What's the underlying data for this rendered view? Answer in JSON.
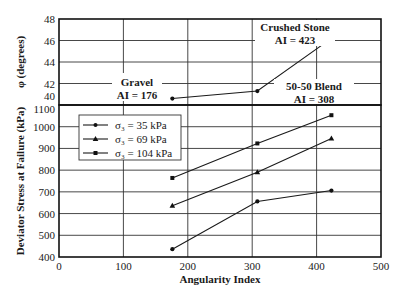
{
  "chart_data": [
    {
      "type": "line",
      "panel": "top",
      "title": "",
      "xlabel": "",
      "ylabel": "φ (degrees)",
      "ylim": [
        40,
        48
      ],
      "yticks": [
        40,
        42,
        44,
        46,
        48
      ],
      "xlim": [
        0,
        500
      ],
      "grid": true,
      "series": [
        {
          "name": "Friction angle",
          "x": [
            176,
            308,
            423
          ],
          "values": [
            40.6,
            41.3,
            46.2
          ],
          "marker": "circle"
        }
      ],
      "annotations": [
        {
          "lines": [
            "Gravel",
            "AI = 176"
          ],
          "x": 176,
          "y": 40.6
        },
        {
          "lines": [
            "50-50 Blend",
            "AI = 308"
          ],
          "x": 308,
          "y": 41.3
        },
        {
          "lines": [
            "Crushed Stone",
            "AI = 423"
          ],
          "x": 423,
          "y": 46.2
        }
      ]
    },
    {
      "type": "line",
      "panel": "bottom",
      "title": "",
      "xlabel": "Angularity Index",
      "ylabel": "Deviator Stress at Failure (kPa)",
      "xlim": [
        0,
        500
      ],
      "xticks": [
        0,
        100,
        200,
        300,
        400,
        500
      ],
      "ylim": [
        400,
        1100
      ],
      "yticks": [
        400,
        500,
        600,
        700,
        800,
        900,
        1000,
        1100
      ],
      "grid": true,
      "legend_position": "upper left",
      "categories": [
        176,
        308,
        423
      ],
      "series": [
        {
          "name": "σ₃ = 35 kPa",
          "values": [
            436,
            656,
            706
          ],
          "marker": "circle"
        },
        {
          "name": "σ₃ = 69 kPa",
          "values": [
            636,
            790,
            946
          ],
          "marker": "triangle"
        },
        {
          "name": "σ₃ = 104 kPa",
          "values": [
            764,
            923,
            1053
          ],
          "marker": "square"
        }
      ]
    }
  ],
  "labels": {
    "top_ylabel": "φ (degrees)",
    "bottom_ylabel": "Deviator Stress at Failure (kPa)",
    "xlabel": "Angularity Index",
    "legend": [
      "σ₃ = 35 kPa",
      "σ₃ = 69 kPa",
      "σ₃ = 104 kPa"
    ],
    "anno_gravel_1": "Gravel",
    "anno_gravel_2": "AI = 176",
    "anno_blend_1": "50-50 Blend",
    "anno_blend_2": "AI = 308",
    "anno_crushed_1": "Crushed Stone",
    "anno_crushed_2": "AI = 423"
  }
}
